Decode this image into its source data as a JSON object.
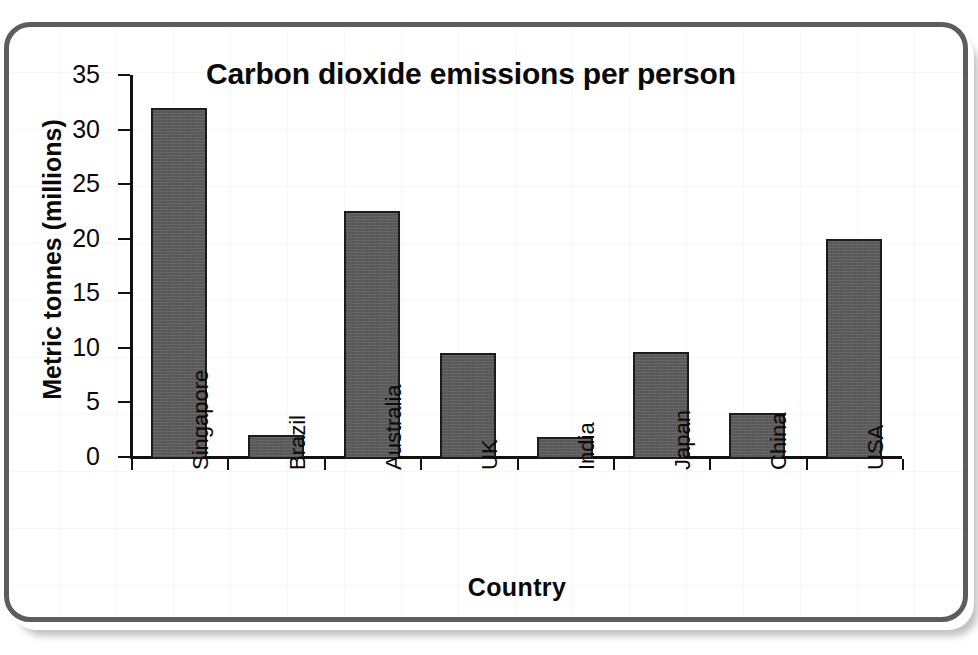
{
  "chart_data": {
    "type": "bar",
    "title": "Carbon dioxide emissions per person",
    "xlabel": "Country",
    "ylabel": "Metric tonnes (millions)",
    "categories": [
      "Singapore",
      "Brazil",
      "Australia",
      "UK",
      "India",
      "Japan",
      "China",
      "USA"
    ],
    "values": [
      32,
      2,
      22.5,
      9.5,
      1.8,
      9.6,
      4,
      20
    ],
    "ylim": [
      0,
      35
    ],
    "y_ticks": [
      0,
      5,
      10,
      15,
      20,
      25,
      30,
      35
    ],
    "y_tick_labels": [
      "0",
      "5",
      "10",
      "15",
      "20",
      "25",
      "30",
      "35"
    ],
    "grid": "faint background paper grid only",
    "legend": "none",
    "bar_color": "#5b5b5b",
    "bar_edge_color": "#1c1c1c",
    "axis_color": "#111111",
    "frame_border_color": "#5d5d5d",
    "background_color": "#ffffff"
  }
}
